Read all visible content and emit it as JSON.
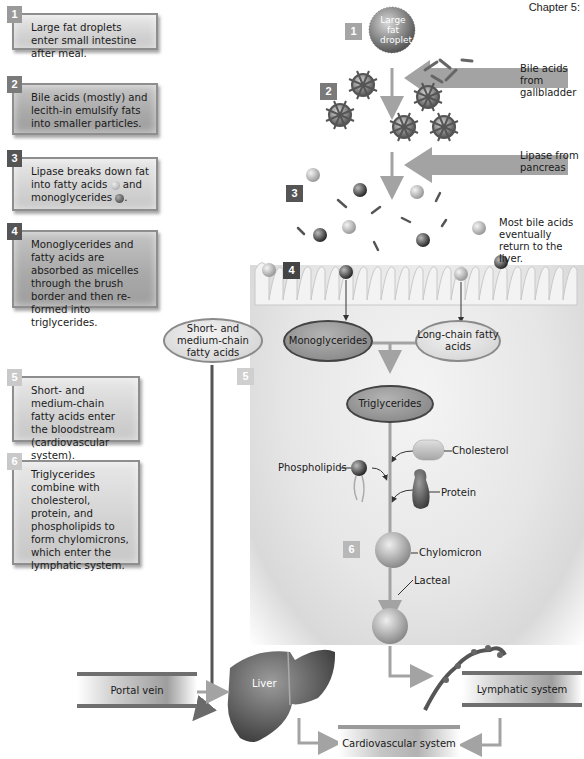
{
  "header": {
    "chapter": "Chapter 5:"
  },
  "steps": [
    {
      "num": "1",
      "text": "Large fat droplets enter small intestine after meal."
    },
    {
      "num": "2",
      "text": "Bile acids (mostly) and lecith-in emulsify fats into smaller particles."
    },
    {
      "num": "3",
      "text_before": "Lipase breaks down fat into fatty acids",
      "text_mid": "and monoglycerides",
      "text_after": "."
    },
    {
      "num": "4",
      "text": "Monoglycerides and fatty acids are absorbed as micelles through the brush border and then re-formed into triglycerides."
    },
    {
      "num": "5",
      "text": "Short- and medium-chain fatty acids enter the bloodstream (cardiovascular system)."
    },
    {
      "num": "6",
      "text": "Triglycerides combine with cholesterol, protein, and phospholipids to form chylomicrons, which enter the lymphatic system."
    }
  ],
  "diagram": {
    "droplet_label": "Large fat droplet",
    "bile_label": "Bile acids from gallbladder",
    "lipase_label": "Lipase from pancreas",
    "bile_return_label": "Most bile acids eventually return to the liver.",
    "short_chain": "Short- and medium-chain fatty acids",
    "monoglycerides": "Monoglycerides",
    "long_chain": "Long-chain fatty acids",
    "triglycerides": "Triglycerides",
    "cholesterol": "Cholesterol",
    "phospholipids": "Phospholipids",
    "protein": "Protein",
    "chylomicron": "Chylomicron",
    "lacteal": "Lacteal",
    "liver": "Liver",
    "portal_vein": "Portal vein",
    "lymphatic": "Lymphatic system",
    "cardiovascular": "Cardiovascular system",
    "badges": [
      "1",
      "2",
      "3",
      "4",
      "5",
      "6"
    ]
  },
  "colors": {
    "arrow": "#a3a3a3",
    "dark_arrow": "#555555",
    "badge_dark": "#555555",
    "badge_light": "#a0a0a0"
  }
}
